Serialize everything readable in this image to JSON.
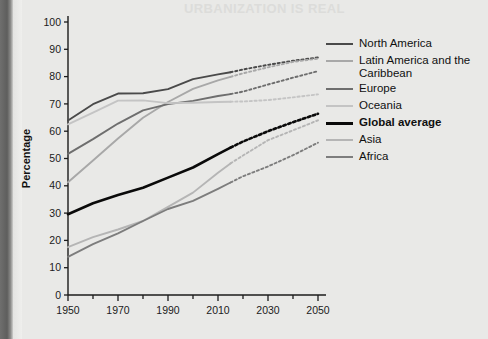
{
  "figure": {
    "ghost_heading": "URBANIZATION IS REAL",
    "background_color": "#e9e9e7"
  },
  "axes": {
    "ylabel": "Percentage",
    "y_ticks": [
      "0",
      "10",
      "20",
      "30",
      "40",
      "50",
      "60",
      "70",
      "80",
      "90",
      "100"
    ],
    "x_ticks": [
      "1950",
      "1970",
      "1990",
      "2010",
      "2030",
      "2050"
    ]
  },
  "legend": {
    "items": [
      {
        "label": "North America",
        "color": "#4a4a4a",
        "bold": false,
        "width": 2.2
      },
      {
        "label": "Latin America and the Caribbean",
        "color": "#a8a8a8",
        "bold": false,
        "width": 2.0
      },
      {
        "label": "Europe",
        "color": "#6e6e6e",
        "bold": false,
        "width": 2.2
      },
      {
        "label": "Oceania",
        "color": "#c4c4c4",
        "bold": false,
        "width": 2.0
      },
      {
        "label": "Global average",
        "color": "#0a0a0a",
        "bold": true,
        "width": 3.0
      },
      {
        "label": "Asia",
        "color": "#b5b5b5",
        "bold": false,
        "width": 2.0
      },
      {
        "label": "Africa",
        "color": "#7d7d7d",
        "bold": false,
        "width": 2.2
      }
    ]
  },
  "chart_data": {
    "type": "line",
    "title": "",
    "xlabel": "",
    "ylabel": "Percentage",
    "xlim": [
      1950,
      2050
    ],
    "ylim": [
      0,
      100
    ],
    "grid": false,
    "legend_position": "right",
    "projection_start_year": 2015,
    "note": "Solid segments are observed data (1950-2015); dotted segments are projections (2015-2050).",
    "x": [
      1950,
      1960,
      1970,
      1980,
      1990,
      2000,
      2010,
      2015,
      2020,
      2030,
      2040,
      2050
    ],
    "series": [
      {
        "name": "North America",
        "color": "#4a4a4a",
        "values": [
          63.9,
          69.9,
          73.8,
          73.9,
          75.4,
          79.1,
          80.8,
          81.6,
          82.6,
          84.3,
          85.8,
          87.0
        ]
      },
      {
        "name": "Latin America and the Caribbean",
        "color": "#a8a8a8",
        "values": [
          41.3,
          49.3,
          57.3,
          64.9,
          70.7,
          75.5,
          78.6,
          79.9,
          81.2,
          83.4,
          85.4,
          86.6
        ]
      },
      {
        "name": "Europe",
        "color": "#6e6e6e",
        "values": [
          51.7,
          57.1,
          62.8,
          67.6,
          69.9,
          71.1,
          72.9,
          73.6,
          74.5,
          77.1,
          79.6,
          82.0
        ]
      },
      {
        "name": "Oceania",
        "color": "#c4c4c4",
        "values": [
          62.5,
          66.8,
          71.2,
          71.3,
          70.3,
          70.4,
          70.7,
          70.8,
          70.9,
          71.4,
          72.4,
          73.5
        ]
      },
      {
        "name": "Global average",
        "color": "#0a0a0a",
        "values": [
          29.6,
          33.6,
          36.6,
          39.3,
          43.0,
          46.7,
          51.6,
          54.0,
          56.2,
          60.0,
          63.3,
          66.4
        ]
      },
      {
        "name": "Asia",
        "color": "#b5b5b5",
        "values": [
          17.5,
          21.2,
          24.0,
          27.1,
          32.3,
          37.5,
          44.8,
          48.2,
          51.1,
          56.7,
          60.3,
          64.0
        ]
      },
      {
        "name": "Africa",
        "color": "#7d7d7d",
        "values": [
          14.0,
          18.6,
          22.6,
          27.1,
          31.5,
          34.5,
          38.9,
          41.2,
          43.5,
          47.1,
          51.2,
          55.8
        ]
      }
    ]
  }
}
